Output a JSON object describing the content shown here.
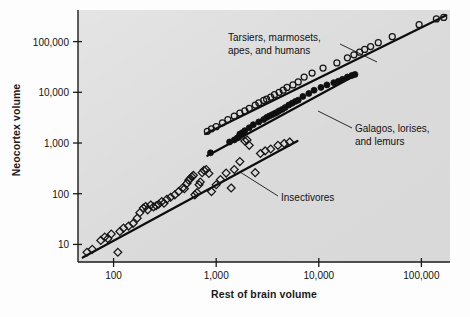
{
  "figure": {
    "background_color": "#fdfdfd",
    "plot_background_color": "#d9d9d9",
    "axis_color": "#1a1a1a",
    "marker_color": "#111111"
  },
  "chart_data": {
    "type": "scatter",
    "title": "",
    "xlabel": "Rest of brain volume",
    "ylabel": "Neocortex volume",
    "xscale": "log",
    "yscale": "log",
    "xlim": [
      45,
      190000
    ],
    "ylim": [
      4.5,
      420000
    ],
    "grid": false,
    "legend_position": "annotations-on-plot",
    "xticks": [
      100,
      1000,
      10000,
      100000
    ],
    "xtick_labels": [
      "100",
      "1,000",
      "10,000",
      "100,000"
    ],
    "yticks": [
      10,
      100,
      1000,
      10000,
      100000
    ],
    "ytick_labels": [
      "10",
      "100",
      "1,000",
      "10,000",
      "100,000"
    ],
    "annotations": [
      {
        "name": "anthropoids-label",
        "text_lines": [
          "Tarsiers, marmosets,",
          "apes, and humans"
        ],
        "label_x_px": 228,
        "label_y_px": 32,
        "leader_from_px": [
          340,
          44
        ],
        "leader_to_px": [
          377,
          62
        ]
      },
      {
        "name": "strepsirrhines-label",
        "text_lines": [
          "Galagos, lorises,",
          "and lemurs"
        ],
        "label_x_px": 355,
        "label_y_px": 123,
        "leader_from_px": [
          352,
          128
        ],
        "leader_to_px": [
          318,
          111
        ]
      },
      {
        "name": "insectivores-label",
        "text_lines": [
          "Insectivores"
        ],
        "label_x_px": 281,
        "label_y_px": 192,
        "leader_from_px": [
          278,
          196
        ],
        "leader_to_px": [
          240,
          172
        ]
      }
    ],
    "series": [
      {
        "name": "Tarsiers, marmosets, apes, and humans",
        "marker": "open-circle",
        "marker_size": 6,
        "trendline": {
          "x": [
            780,
            175000
          ],
          "y": [
            1500,
            330000
          ]
        },
        "points": [
          [
            820,
            1700
          ],
          [
            900,
            1900
          ],
          [
            1000,
            2100
          ],
          [
            1150,
            2500
          ],
          [
            1300,
            2900
          ],
          [
            1500,
            3400
          ],
          [
            1700,
            3900
          ],
          [
            1900,
            4300
          ],
          [
            2100,
            4800
          ],
          [
            2400,
            5600
          ],
          [
            2600,
            6200
          ],
          [
            2900,
            6900
          ],
          [
            3100,
            7300
          ],
          [
            3400,
            8000
          ],
          [
            3700,
            9000
          ],
          [
            4100,
            10000
          ],
          [
            4500,
            11000
          ],
          [
            4900,
            12500
          ],
          [
            5600,
            14000
          ],
          [
            6300,
            16000
          ],
          [
            7200,
            20000
          ],
          [
            8600,
            24000
          ],
          [
            11000,
            30000
          ],
          [
            15000,
            38000
          ],
          [
            19000,
            48000
          ],
          [
            22000,
            55000
          ],
          [
            25000,
            62000
          ],
          [
            28000,
            70000
          ],
          [
            32000,
            80000
          ],
          [
            38000,
            95000
          ],
          [
            52000,
            125000
          ],
          [
            95000,
            215000
          ],
          [
            140000,
            280000
          ],
          [
            165000,
            300000
          ]
        ]
      },
      {
        "name": "Galagos, lorises, and lemurs",
        "marker": "filled-circle",
        "marker_size": 6,
        "trendline": {
          "x": [
            820,
            23000
          ],
          "y": [
            560,
            22000
          ]
        },
        "points": [
          [
            880,
            640
          ],
          [
            1350,
            1050
          ],
          [
            1500,
            1150
          ],
          [
            1600,
            1250
          ],
          [
            1650,
            1300
          ],
          [
            1700,
            1500
          ],
          [
            1800,
            1600
          ],
          [
            1900,
            1750
          ],
          [
            2100,
            2000
          ],
          [
            2300,
            2300
          ],
          [
            2600,
            2600
          ],
          [
            2900,
            2900
          ],
          [
            3100,
            3200
          ],
          [
            3300,
            3400
          ],
          [
            3500,
            3600
          ],
          [
            3700,
            3800
          ],
          [
            3900,
            4000
          ],
          [
            4100,
            4300
          ],
          [
            4400,
            4600
          ],
          [
            4700,
            5000
          ],
          [
            5100,
            5600
          ],
          [
            5500,
            6100
          ],
          [
            5900,
            6600
          ],
          [
            6300,
            7000
          ],
          [
            7000,
            8300
          ],
          [
            8000,
            9500
          ],
          [
            9000,
            11000
          ],
          [
            10500,
            12500
          ],
          [
            12000,
            14000
          ],
          [
            14000,
            15500
          ],
          [
            15500,
            16500
          ],
          [
            17000,
            18000
          ],
          [
            19000,
            20000
          ],
          [
            21000,
            21500
          ],
          [
            22500,
            22500
          ]
        ]
      },
      {
        "name": "Insectivores",
        "marker": "open-diamond",
        "marker_size": 7,
        "trendline": {
          "x": [
            50,
            6200
          ],
          "y": [
            5.5,
            1100
          ]
        },
        "points": [
          [
            55,
            7
          ],
          [
            62,
            8
          ],
          [
            75,
            12
          ],
          [
            82,
            14
          ],
          [
            88,
            13
          ],
          [
            95,
            16
          ],
          [
            110,
            7
          ],
          [
            115,
            18
          ],
          [
            125,
            21
          ],
          [
            140,
            23
          ],
          [
            155,
            26
          ],
          [
            170,
            33
          ],
          [
            180,
            42
          ],
          [
            195,
            52
          ],
          [
            205,
            56
          ],
          [
            215,
            48
          ],
          [
            230,
            60
          ],
          [
            245,
            55
          ],
          [
            260,
            58
          ],
          [
            275,
            62
          ],
          [
            295,
            70
          ],
          [
            310,
            65
          ],
          [
            330,
            78
          ],
          [
            360,
            85
          ],
          [
            395,
            95
          ],
          [
            430,
            110
          ],
          [
            470,
            130
          ],
          [
            490,
            125
          ],
          [
            520,
            160
          ],
          [
            540,
            185
          ],
          [
            560,
            200
          ],
          [
            580,
            215
          ],
          [
            600,
            230
          ],
          [
            620,
            95
          ],
          [
            650,
            105
          ],
          [
            680,
            150
          ],
          [
            700,
            170
          ],
          [
            730,
            260
          ],
          [
            760,
            290
          ],
          [
            800,
            300
          ],
          [
            850,
            250
          ],
          [
            900,
            110
          ],
          [
            1000,
            150
          ],
          [
            1100,
            190
          ],
          [
            1250,
            255
          ],
          [
            1400,
            130
          ],
          [
            1500,
            300
          ],
          [
            1700,
            430
          ],
          [
            1900,
            1100
          ],
          [
            2000,
            1150
          ],
          [
            2100,
            900
          ],
          [
            2400,
            260
          ],
          [
            2700,
            620
          ],
          [
            3000,
            700
          ],
          [
            3400,
            760
          ],
          [
            4000,
            900
          ],
          [
            4600,
            980
          ],
          [
            5200,
            1050
          ]
        ]
      }
    ]
  }
}
